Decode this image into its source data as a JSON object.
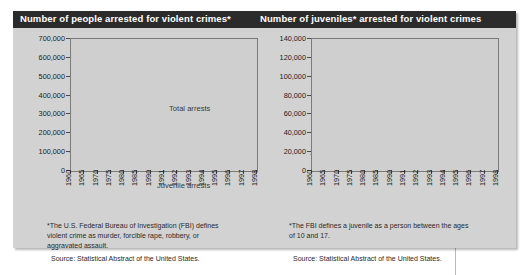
{
  "panels": {
    "left": {
      "title": "Number of people arrested for violent crimes*",
      "footnote": "*The U.S. Federal Bureau of Investigation (FBI) defines\nviolent crime as murder, forcible rape, robbery, or\naggravated assault.",
      "source": "Source: Statistical Abstract of the United States.",
      "label_total": "Total arrests",
      "label_juvenile": "Juvenile arrests"
    },
    "right": {
      "title": "Number of juveniles* arrested for violent crimes",
      "footnote": "*The FBI defines a juvenile as a person between the ages\nof 10 and 17.",
      "source": "Source: Statistical Abstract of the United States."
    }
  },
  "chart_data": [
    {
      "id": "people-arrested",
      "type": "line",
      "title": "Number of people arrested for violent crimes*",
      "xlabel": "",
      "ylabel": "",
      "grid": false,
      "legend_position": "inline-right",
      "ylim": [
        0,
        700000
      ],
      "yticks": [
        0,
        100000,
        200000,
        300000,
        400000,
        500000,
        600000,
        700000
      ],
      "ytick_labels": [
        "0",
        "100,000",
        "200,000",
        "300,000",
        "400,000",
        "500,000",
        "600,000",
        "700,000"
      ],
      "categories": [
        "1960",
        "1965",
        "1970",
        "1975",
        "1980",
        "1985",
        "1990",
        "1991",
        "1992",
        "1993",
        "1994",
        "1995",
        "1996",
        "1997",
        "1998"
      ],
      "series": [
        {
          "name": "Total arrests",
          "values": [
            90000,
            180000,
            235000,
            360000,
            445000,
            425000,
            560000,
            555000,
            600000,
            645000,
            650000,
            650000,
            620000,
            560000,
            530000
          ]
        },
        {
          "name": "Juvenile arrests",
          "values": [
            20000,
            38000,
            55000,
            72000,
            78000,
            78000,
            95000,
            100000,
            108000,
            118000,
            125000,
            120000,
            108000,
            98000,
            90000
          ]
        }
      ]
    },
    {
      "id": "juveniles-arrested",
      "type": "line",
      "title": "Number of juveniles* arrested for violent crimes",
      "xlabel": "",
      "ylabel": "",
      "grid": false,
      "legend_position": "none",
      "ylim": [
        0,
        140000
      ],
      "yticks": [
        0,
        20000,
        40000,
        60000,
        80000,
        100000,
        120000,
        140000
      ],
      "ytick_labels": [
        "0",
        "20,000",
        "40,000",
        "60,000",
        "80,000",
        "100,000",
        "120,000",
        "140,000"
      ],
      "categories": [
        "1960",
        "1965",
        "1970",
        "1975",
        "1980",
        "1985",
        "1990",
        "1991",
        "1992",
        "1993",
        "1994",
        "1995",
        "1996",
        "1997",
        "1998"
      ],
      "series": [
        {
          "name": "Juvenile arrests",
          "values": [
            16000,
            38000,
            62000,
            80000,
            82000,
            76000,
            96000,
            97000,
            97000,
            112000,
            118000,
            122000,
            133000,
            102000,
            96000
          ]
        }
      ]
    }
  ],
  "colors": {
    "title_band": "#2b2b2b",
    "card": "#d2d2d2",
    "plot_bg": "#cfcfcf",
    "line": "#3b3b3b",
    "frame": "#7b7b7b"
  }
}
